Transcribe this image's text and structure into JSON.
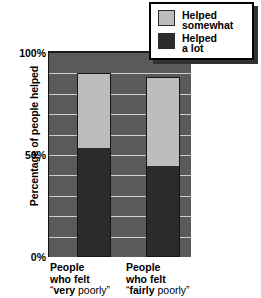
{
  "chart_data": {
    "type": "bar",
    "subtype": "stacked-vertical",
    "title": "",
    "xlabel": "",
    "ylabel": "Percentage of people helped",
    "ylim": [
      0,
      100
    ],
    "y_tick_labels": [
      "0%",
      "50%",
      "100%"
    ],
    "y_tick_values": [
      0,
      50,
      100
    ],
    "grid": true,
    "grid_interval": 10,
    "legend_position": "top-right",
    "categories": [
      "People who felt \"very poorly\"",
      "People who felt \"fairly poorly\""
    ],
    "series": [
      {
        "name": "Helped a lot",
        "values": [
          54,
          45
        ],
        "color": "#2b2b2b"
      },
      {
        "name": "Helped somewhat",
        "values": [
          36,
          43
        ],
        "color": "#bdbdbd"
      }
    ],
    "totals": [
      90,
      88
    ],
    "plot_background": "#5a5a5a",
    "gridline_color": "#cfcfcf"
  },
  "axis": {
    "y_title": "Percentage of people helped",
    "ticks": {
      "top": "100%",
      "middle": "50%",
      "bottom": "0%"
    }
  },
  "legend": {
    "items": [
      {
        "label": "Helped\nsomewhat",
        "swatch_color": "#bdbdbd"
      },
      {
        "label": "Helped\na lot",
        "swatch_color": "#2b2b2b"
      }
    ]
  },
  "categories": [
    {
      "line1": "People",
      "line2": "who felt",
      "emphasis": "very",
      "quote_prefix": "“",
      "quote_suffix": " poorly”"
    },
    {
      "line1": "People",
      "line2": "who felt",
      "emphasis": "fairly",
      "quote_prefix": "“",
      "quote_suffix": " poorly”"
    }
  ]
}
